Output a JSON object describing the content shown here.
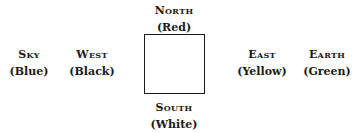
{
  "diagram": {
    "north": {
      "name": "North",
      "color": "(Red)"
    },
    "south": {
      "name": "South",
      "color": "(White)"
    },
    "west": {
      "name": "West",
      "color": "(Black)"
    },
    "east": {
      "name": "East",
      "color": "(Yellow)"
    },
    "sky": {
      "name": "Sky",
      "color": "(Blue)"
    },
    "earth": {
      "name": "Earth",
      "color": "(Green)"
    }
  }
}
